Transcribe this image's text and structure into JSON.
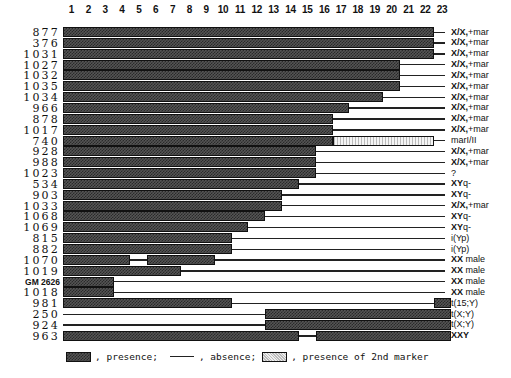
{
  "chart_data": {
    "type": "heatmap",
    "title": "",
    "xlabel": "",
    "ylabel": "",
    "columns": [
      "1",
      "2",
      "3",
      "4",
      "5",
      "6",
      "7",
      "8",
      "9",
      "10",
      "11",
      "12",
      "13",
      "14",
      "15",
      "16",
      "17",
      "18",
      "19",
      "20",
      "21",
      "22",
      "23"
    ],
    "rows": [
      {
        "id": "877",
        "karyotype": "X/X,+mar",
        "segments": [
          {
            "from": 1,
            "to": 22,
            "type": "presence"
          }
        ]
      },
      {
        "id": "376",
        "karyotype": "X/X,+mar",
        "segments": [
          {
            "from": 1,
            "to": 22,
            "type": "presence"
          }
        ]
      },
      {
        "id": "1031",
        "karyotype": "X/X,+mar",
        "segments": [
          {
            "from": 1,
            "to": 22,
            "type": "presence"
          }
        ]
      },
      {
        "id": "1027",
        "karyotype": "X/X,+mar",
        "segments": [
          {
            "from": 1,
            "to": 20,
            "type": "presence"
          }
        ]
      },
      {
        "id": "1032",
        "karyotype": "X/X,+mar",
        "segments": [
          {
            "from": 1,
            "to": 20,
            "type": "presence"
          }
        ]
      },
      {
        "id": "1035",
        "karyotype": "X/X,+mar",
        "segments": [
          {
            "from": 1,
            "to": 20,
            "type": "presence"
          }
        ]
      },
      {
        "id": "1034",
        "karyotype": "X/X,+mar",
        "segments": [
          {
            "from": 1,
            "to": 19,
            "type": "presence"
          }
        ]
      },
      {
        "id": "966",
        "karyotype": "X/X,+mar",
        "segments": [
          {
            "from": 1,
            "to": 17,
            "type": "presence"
          }
        ]
      },
      {
        "id": "878",
        "karyotype": "X/X,+mar",
        "segments": [
          {
            "from": 1,
            "to": 16,
            "type": "presence"
          }
        ]
      },
      {
        "id": "1017",
        "karyotype": "X/X,+mar",
        "segments": [
          {
            "from": 1,
            "to": 16,
            "type": "presence"
          }
        ]
      },
      {
        "id": "740",
        "karyotype": "marI/II",
        "segments": [
          {
            "from": 1,
            "to": 16,
            "type": "presence"
          },
          {
            "from": 17,
            "to": 22,
            "type": "second_marker"
          }
        ]
      },
      {
        "id": "928",
        "karyotype": "X/X,+mar",
        "segments": [
          {
            "from": 1,
            "to": 15,
            "type": "presence"
          }
        ]
      },
      {
        "id": "988",
        "karyotype": "X/X,+mar",
        "segments": [
          {
            "from": 1,
            "to": 15,
            "type": "presence"
          }
        ]
      },
      {
        "id": "1023",
        "karyotype": "?",
        "segments": [
          {
            "from": 1,
            "to": 15,
            "type": "presence"
          }
        ]
      },
      {
        "id": "534",
        "karyotype": "XYq-",
        "segments": [
          {
            "from": 1,
            "to": 14,
            "type": "presence"
          }
        ]
      },
      {
        "id": "903",
        "karyotype": "XYq-",
        "segments": [
          {
            "from": 1,
            "to": 13,
            "type": "presence"
          }
        ]
      },
      {
        "id": "1033",
        "karyotype": "X/X,+mar",
        "segments": [
          {
            "from": 1,
            "to": 13,
            "type": "presence"
          }
        ]
      },
      {
        "id": "1068",
        "karyotype": "XYq-",
        "segments": [
          {
            "from": 1,
            "to": 12,
            "type": "presence"
          }
        ]
      },
      {
        "id": "1069",
        "karyotype": "XYq-",
        "segments": [
          {
            "from": 1,
            "to": 11,
            "type": "presence"
          }
        ]
      },
      {
        "id": "815",
        "karyotype": "i(Yp)",
        "segments": [
          {
            "from": 1,
            "to": 10,
            "type": "presence"
          }
        ]
      },
      {
        "id": "882",
        "karyotype": "i(Yp)",
        "segments": [
          {
            "from": 1,
            "to": 10,
            "type": "presence"
          }
        ]
      },
      {
        "id": "1070",
        "karyotype": "XX male",
        "segments": [
          {
            "from": 1,
            "to": 4,
            "type": "presence"
          },
          {
            "from": 6,
            "to": 9,
            "type": "presence"
          }
        ]
      },
      {
        "id": "1019",
        "karyotype": "XX male",
        "segments": [
          {
            "from": 1,
            "to": 7,
            "type": "presence"
          }
        ]
      },
      {
        "id": "GM 2626",
        "karyotype": "XX male",
        "segments": [
          {
            "from": 1,
            "to": 3,
            "type": "presence"
          }
        ]
      },
      {
        "id": "1018",
        "karyotype": "XX male",
        "segments": [
          {
            "from": 1,
            "to": 3,
            "type": "presence"
          }
        ]
      },
      {
        "id": "981",
        "karyotype": "t(15;Y)",
        "segments": [
          {
            "from": 1,
            "to": 10,
            "type": "presence"
          },
          {
            "from": 23,
            "to": 23,
            "type": "presence"
          }
        ]
      },
      {
        "id": "250",
        "karyotype": "t(X;Y)",
        "segments": [
          {
            "from": 13,
            "to": 23,
            "type": "presence"
          }
        ]
      },
      {
        "id": "924",
        "karyotype": "t(X;Y)",
        "segments": [
          {
            "from": 13,
            "to": 23,
            "type": "presence"
          }
        ]
      },
      {
        "id": "963",
        "karyotype": "XXY",
        "segments": [
          {
            "from": 1,
            "to": 14,
            "type": "presence"
          },
          {
            "from": 16,
            "to": 23,
            "type": "presence"
          }
        ]
      }
    ],
    "legend": [
      {
        "key": "presence",
        "label": ", presence;"
      },
      {
        "key": "absence",
        "label": ", absence;"
      },
      {
        "key": "second_marker",
        "label": ", presence of 2nd marker"
      }
    ]
  },
  "legend": {
    "presence": ", presence;",
    "absence": ", absence;",
    "second": ", presence of 2nd marker"
  },
  "colors": {
    "presence": "#444444",
    "second_marker": "#e0e0e0",
    "line": "#222222"
  }
}
